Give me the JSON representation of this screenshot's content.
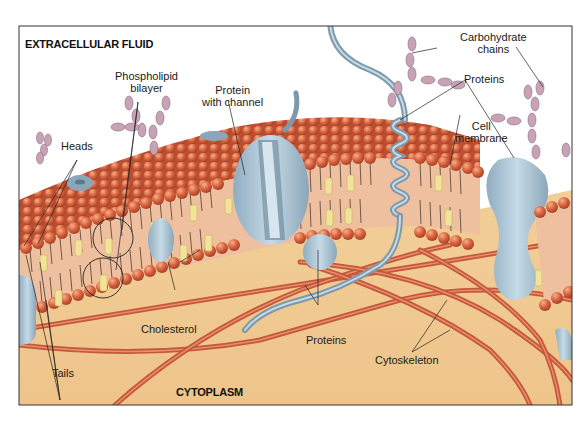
{
  "figure": {
    "regions": {
      "top": "EXTRACELLULAR FLUID",
      "bottom": "CYTOPLASM"
    },
    "labels": {
      "phospholipid_bilayer": [
        "Phospholipid",
        "bilayer"
      ],
      "protein_with_channel": [
        "Protein",
        "with channel"
      ],
      "carbohydrate_chains": [
        "Carbohydrate",
        "chains"
      ],
      "proteins_top": "Proteins",
      "cell_membrane": [
        "Cell",
        "membrane"
      ],
      "heads": "Heads",
      "tails": "Tails",
      "cholesterol": "Cholesterol",
      "proteins_bottom": "Proteins",
      "cytoskeleton": "Cytoskeleton"
    },
    "colors": {
      "extracellular_bg": "#ffffff",
      "cytoplasm_bg": "#f0c98f",
      "phospholipid_head": "#d9643e",
      "head_highlight": "#f4a47a",
      "tail_region": "#eebd9c",
      "tail_line": "#3a2a20",
      "cholesterol": "#f2e39a",
      "protein": "#a9c3d3",
      "protein_dark": "#7d99ab",
      "carbohydrate": "#c8a3b6",
      "cytoskeleton": "#d4694a",
      "frame": "#333333"
    }
  }
}
